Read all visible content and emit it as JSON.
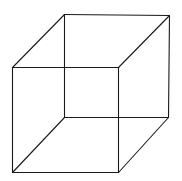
{
  "diagram": {
    "type": "wireframe-cube",
    "stroke_color": "#1a1a1a",
    "background_color": "#ffffff",
    "vertices": {
      "front_top_left": [
        12,
        67
      ],
      "front_top_right": [
        118,
        67
      ],
      "front_bottom_left": [
        12,
        172
      ],
      "front_bottom_right": [
        118,
        172
      ],
      "back_top_left": [
        64,
        14
      ],
      "back_top_right": [
        169,
        15
      ],
      "back_bottom_left": [
        64,
        117
      ],
      "back_bottom_right": [
        168,
        117
      ]
    },
    "edges": [
      [
        "front_top_left",
        "front_top_right"
      ],
      [
        "front_top_right",
        "front_bottom_right"
      ],
      [
        "front_bottom_right",
        "front_bottom_left"
      ],
      [
        "front_bottom_left",
        "front_top_left"
      ],
      [
        "back_top_left",
        "back_top_right"
      ],
      [
        "back_top_right",
        "back_bottom_right"
      ],
      [
        "back_bottom_right",
        "back_bottom_left"
      ],
      [
        "back_bottom_left",
        "back_top_left"
      ],
      [
        "front_top_left",
        "back_top_left"
      ],
      [
        "front_top_right",
        "back_top_right"
      ],
      [
        "front_bottom_left",
        "back_bottom_left"
      ],
      [
        "front_bottom_right",
        "back_bottom_right"
      ]
    ]
  }
}
